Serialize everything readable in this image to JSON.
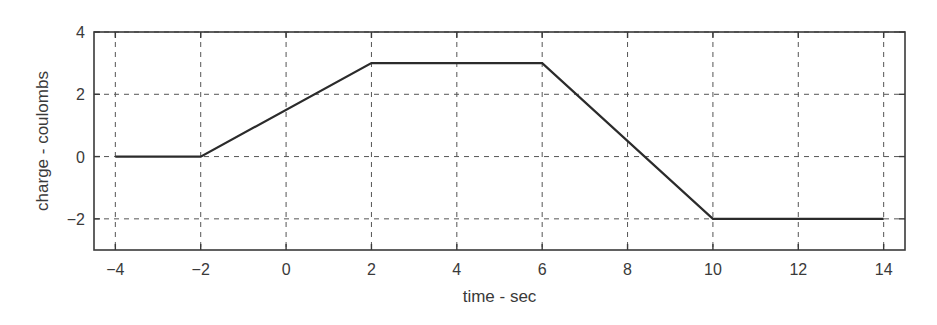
{
  "chart_data": {
    "type": "line",
    "title": "",
    "xlabel": "time - sec",
    "ylabel": "charge - coulombs",
    "xlim": [
      -4.5,
      14.5
    ],
    "ylim": [
      -3,
      4
    ],
    "xticks": [
      -4,
      -2,
      0,
      2,
      4,
      6,
      8,
      10,
      12,
      14
    ],
    "xtick_labels": [
      "−4",
      "−2",
      "0",
      "2",
      "4",
      "6",
      "8",
      "10",
      "12",
      "14"
    ],
    "yticks": [
      -2,
      0,
      2,
      4
    ],
    "ytick_labels": [
      "−2",
      "0",
      "2",
      "4"
    ],
    "grid": true,
    "grid_style": "dashed",
    "legend": null,
    "series": [
      {
        "name": "charge",
        "color": "#2b2b2b",
        "x": [
          -4,
          -2,
          2,
          6,
          10,
          14
        ],
        "y": [
          0,
          0,
          3,
          3,
          -2,
          -2
        ]
      }
    ]
  },
  "colors": {
    "axis": "#3a3a3a",
    "grid": "#555555",
    "line": "#2b2b2b",
    "background": "#ffffff"
  }
}
